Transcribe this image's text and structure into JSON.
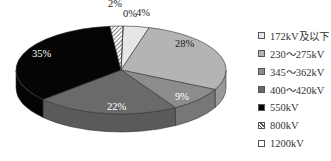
{
  "chart_data": {
    "type": "pie",
    "style": "3d",
    "title": "",
    "categories": [
      "172kV及以下",
      "230～275kV",
      "345～362kV",
      "400～420kV",
      "550kV",
      "800kV",
      "1200kV"
    ],
    "values": [
      4,
      28,
      9,
      22,
      35,
      2,
      0
    ],
    "labels": [
      "4%",
      "28%",
      "9%",
      "22%",
      "35%",
      "2%",
      "0%"
    ],
    "colors": [
      "#e6e6e6",
      "#b4b4b4",
      "#8c8c8c",
      "#6a6a6a",
      "#050505",
      "#ffffff",
      "#ffffff"
    ],
    "patterns": [
      "solid",
      "solid",
      "solid",
      "solid",
      "solid",
      "hatched",
      "solid"
    ],
    "label_colors": [
      "#222222",
      "#222222",
      "#ffffff",
      "#ffffff",
      "#ffffff",
      "#222222",
      "#222222"
    ],
    "legend_position": "right"
  },
  "legend": {
    "items": [
      {
        "label": "172kV及以下",
        "color": "#e6e6e6"
      },
      {
        "label": "230～275kV",
        "color": "#b4b4b4"
      },
      {
        "label": "345～362kV",
        "color": "#8c8c8c"
      },
      {
        "label": "400～420kV",
        "color": "#6a6a6a"
      },
      {
        "label": "550kV",
        "color": "#050505"
      },
      {
        "label": "800kV",
        "color": "hatched"
      },
      {
        "label": "1200kV",
        "color": "#ffffff"
      }
    ]
  }
}
